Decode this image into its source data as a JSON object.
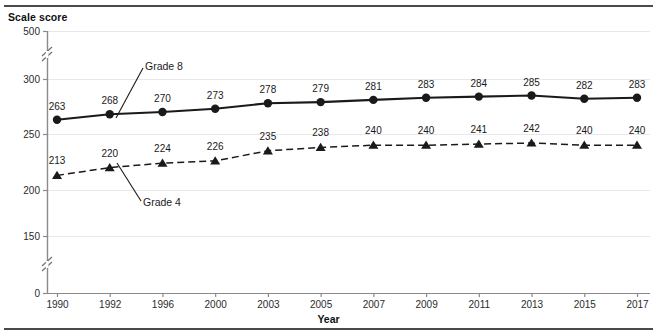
{
  "chart_data": {
    "type": "line",
    "title": "",
    "ylabel": "Scale score",
    "xlabel": "Year",
    "categories": [
      "1990",
      "1992",
      "1996",
      "2000",
      "2003",
      "2005",
      "2007",
      "2009",
      "2011",
      "2013",
      "2015",
      "2017"
    ],
    "yticks": [
      "0",
      "150",
      "200",
      "250",
      "300",
      "500"
    ],
    "ylim": [
      0,
      500
    ],
    "grid": "horizontal-faint",
    "axis_breaks": [
      "between 0 and 150",
      "between 300 and 500"
    ],
    "legend": "inline-annotations",
    "series": [
      {
        "name": "Grade 8",
        "marker": "circle",
        "linestyle": "solid",
        "color": "#1a1a1a",
        "values": [
          263,
          268,
          270,
          273,
          278,
          279,
          281,
          283,
          284,
          285,
          282,
          283
        ]
      },
      {
        "name": "Grade 4",
        "marker": "triangle",
        "linestyle": "dashed",
        "color": "#1a1a1a",
        "values": [
          213,
          220,
          224,
          226,
          235,
          238,
          240,
          240,
          241,
          242,
          240,
          240
        ]
      }
    ],
    "annotations": [
      {
        "name": "grade-8-callout",
        "text": "Grade 8"
      },
      {
        "name": "grade-4-callout",
        "text": "Grade 4"
      }
    ]
  }
}
